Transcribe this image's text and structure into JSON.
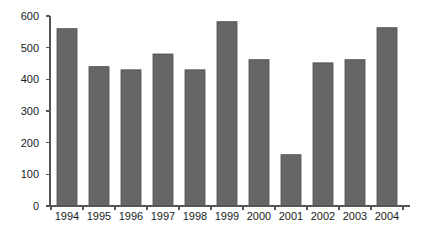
{
  "chart_data": {
    "type": "bar",
    "title": "",
    "subtitle": "",
    "xlabel": "",
    "ylabel": "",
    "categories": [
      "1994",
      "1995",
      "1996",
      "1997",
      "1998",
      "1999",
      "2000",
      "2001",
      "2002",
      "2003",
      "2004"
    ],
    "values": [
      560,
      440,
      430,
      480,
      430,
      582,
      462,
      162,
      452,
      462,
      563
    ],
    "ylim": [
      0,
      600
    ],
    "y_ticks": [
      0,
      100,
      200,
      300,
      400,
      500,
      600
    ],
    "y_tick_labels": [
      "0",
      "100",
      "200",
      "300",
      "400",
      "500",
      "600"
    ],
    "x_tick_labels": [
      "1994",
      "1995",
      "1996",
      "1997",
      "1998",
      "1999",
      "2000",
      "2001",
      "2002",
      "2003",
      "2004"
    ],
    "grid": false,
    "legend": null,
    "legend_position": "none",
    "annotations": [],
    "bar_color": "#666666",
    "bar_edge_color": "#4d4d4d",
    "axis_color": "#555555",
    "background_color": "#ffffff"
  },
  "plot_geometry": {
    "baseline_y": 206,
    "top_y": 16,
    "axis_left_x": 50,
    "axis_right_x": 410,
    "bar_width": 20,
    "bar_pitch": 32,
    "first_bar_left": 57,
    "tick_length": 4,
    "x_label_y": 220,
    "y_label_offset": 7
  }
}
